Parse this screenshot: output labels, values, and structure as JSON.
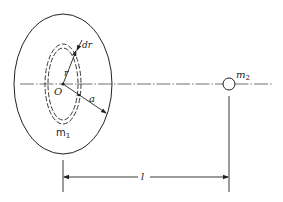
{
  "diagram": {
    "labels": {
      "dr": "dr",
      "r": "r",
      "center": "O",
      "radius": "a",
      "mass1": "m",
      "mass1_sub": "1",
      "mass2": "m",
      "mass2_sub": "2",
      "distance": "l"
    },
    "colors": {
      "stroke": "#222222",
      "background": "#ffffff"
    }
  }
}
